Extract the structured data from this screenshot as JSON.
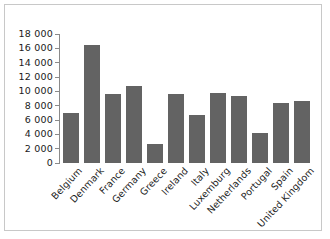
{
  "chart_data": {
    "type": "bar",
    "title": "",
    "subtitle": "",
    "xlabel": "",
    "ylabel": "",
    "ylim": [
      0,
      18000
    ],
    "ytick_step": 2000,
    "grid": false,
    "legend": null,
    "bar_color": "#636363",
    "axis_color": "#8a8a8a",
    "frame_color": "#c8c8c8",
    "ytick_labels": [
      "18 000",
      "16 000",
      "14 000",
      "12 000",
      "10 000",
      "8 000",
      "6 000",
      "4 000",
      "2 000",
      "0"
    ],
    "ytick_values": [
      18000,
      16000,
      14000,
      12000,
      10000,
      8000,
      6000,
      4000,
      2000,
      0
    ],
    "categories": [
      "Belgium",
      "Denmark",
      "France",
      "Germany",
      "Greece",
      "Ireland",
      "Italy",
      "Luxemburg",
      "Netherlands",
      "Portugal",
      "Spain",
      "United Kingdom"
    ],
    "values": [
      7000,
      16500,
      9600,
      10800,
      2600,
      9600,
      6700,
      9800,
      9300,
      4200,
      8400,
      8600
    ]
  }
}
